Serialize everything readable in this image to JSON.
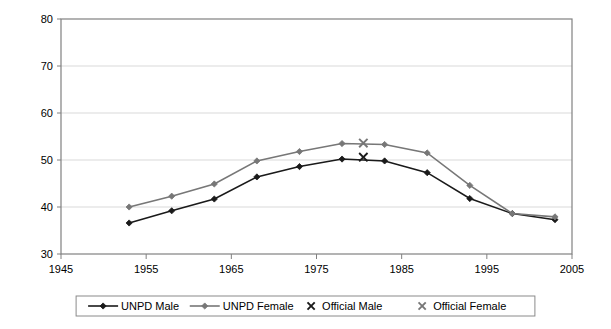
{
  "chart_data": {
    "type": "line",
    "title": "",
    "xlabel": "",
    "ylabel": "",
    "xlim": [
      1945,
      2005
    ],
    "ylim": [
      30,
      80
    ],
    "xticks": [
      1945,
      1955,
      1965,
      1975,
      1985,
      1995,
      2005
    ],
    "yticks": [
      30,
      40,
      50,
      60,
      70,
      80
    ],
    "grid": "horizontal",
    "legend_position": "bottom",
    "x": [
      1953,
      1958,
      1963,
      1968,
      1973,
      1978,
      1983,
      1988,
      1993,
      1998,
      2003
    ],
    "series": [
      {
        "name": "UNPD Male",
        "type": "line",
        "color": "#1a1a1a",
        "marker": "diamond",
        "values": [
          36.6,
          39.2,
          41.7,
          46.4,
          48.6,
          50.2,
          49.8,
          47.3,
          41.8,
          38.6,
          37.3
        ]
      },
      {
        "name": "UNPD Female",
        "type": "line",
        "color": "#777777",
        "marker": "diamond",
        "values": [
          40.0,
          42.3,
          44.9,
          49.8,
          51.8,
          53.5,
          53.3,
          51.5,
          44.6,
          38.6,
          37.9
        ]
      },
      {
        "name": "Official Male",
        "type": "scatter",
        "color": "#1a1a1a",
        "marker": "x",
        "points": [
          {
            "x": 1980.5,
            "y": 50.6
          }
        ]
      },
      {
        "name": "Official Female",
        "type": "scatter",
        "color": "#777777",
        "marker": "x",
        "points": [
          {
            "x": 1980.5,
            "y": 53.6
          }
        ]
      }
    ],
    "legend": [
      {
        "label": "UNPD Male",
        "marker": "line-diamond",
        "color": "#1a1a1a"
      },
      {
        "label": "UNPD Female",
        "marker": "line-diamond",
        "color": "#777777"
      },
      {
        "label": "Official Male",
        "marker": "x",
        "color": "#1a1a1a"
      },
      {
        "label": "Official Female",
        "marker": "x",
        "color": "#777777"
      }
    ]
  },
  "axes": {
    "y_tick_labels": [
      "80",
      "70",
      "60",
      "50",
      "40",
      "30"
    ],
    "x_tick_labels": [
      "1945",
      "1955",
      "1965",
      "1975",
      "1985",
      "1995",
      "2005"
    ]
  },
  "legend": {
    "items": [
      {
        "label": "UNPD Male"
      },
      {
        "label": "UNPD Female"
      },
      {
        "label": "Official Male"
      },
      {
        "label": "Official Female"
      }
    ]
  },
  "colors": {
    "male": "#1a1a1a",
    "female": "#777777",
    "grid": "#d9d9d9",
    "frame": "#808080",
    "background": "#ffffff"
  }
}
